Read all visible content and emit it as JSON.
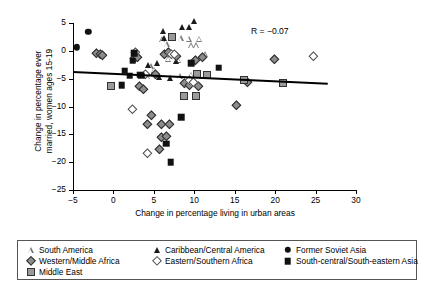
{
  "chart_data": {
    "type": "scatter",
    "title": "",
    "xlabel": "Change in percentage living in urban areas",
    "ylabel": "Change in percentage ever\nmarried, women ages 15-19",
    "xlim": [
      -5,
      30
    ],
    "ylim": [
      -25,
      5
    ],
    "xticks": [
      -5,
      0,
      5,
      10,
      15,
      20,
      25,
      30
    ],
    "yticks": [
      5,
      0,
      -5,
      -10,
      -15,
      -20,
      -25
    ],
    "grid": false,
    "legend_position": "below-plot",
    "annotation": "R = −0.07",
    "trendline": {
      "x0": -5,
      "y0": -3.6,
      "x1": 26.5,
      "y1": -5.7
    },
    "series": [
      {
        "name": "South America",
        "marker": "triangle-open",
        "color": "#7a7a7a",
        "points": [
          [
            6.0,
            2.1
          ],
          [
            6.6,
            1.2
          ],
          [
            8.3,
            2.3
          ],
          [
            9.3,
            2.2
          ],
          [
            9.6,
            1.0
          ],
          [
            10.2,
            1.0
          ],
          [
            10.6,
            2.2
          ],
          [
            11.3,
            -0.6
          ],
          [
            6.8,
            -1.4
          ],
          [
            8.0,
            -1.6
          ],
          [
            4.6,
            -2.7
          ],
          [
            5.0,
            -3.4
          ],
          [
            4.2,
            -4.6
          ],
          [
            8.2,
            -4.6
          ],
          [
            9.6,
            -4.3
          ]
        ]
      },
      {
        "name": "Caribbean/Central America",
        "marker": "triangle-filled",
        "color": "#1a1a1a",
        "points": [
          [
            6.1,
            3.5
          ],
          [
            8.5,
            4.2
          ],
          [
            10.0,
            5.3
          ],
          [
            9.4,
            4.3
          ],
          [
            6.3,
            2.3
          ],
          [
            7.8,
            -1.8
          ],
          [
            5.4,
            -2.2
          ],
          [
            4.3,
            -2.6
          ],
          [
            7.0,
            -4.9
          ],
          [
            5.6,
            -4.7
          ]
        ]
      },
      {
        "name": "Former Soviet Asia",
        "marker": "circle-filled",
        "color": "#111111",
        "points": [
          [
            -3.1,
            3.4
          ],
          [
            -4.5,
            0.6
          ]
        ]
      },
      {
        "name": "Western/Middle Africa",
        "marker": "diamond-gray",
        "color": "#8c8c8c",
        "points": [
          [
            -1.6,
            -1.1
          ],
          [
            -1.2,
            -1.3
          ],
          [
            -0.9,
            -1.5
          ],
          [
            3.0,
            -2.0
          ],
          [
            3.4,
            -1.9
          ],
          [
            6.8,
            -1.2
          ],
          [
            8.2,
            -1.7
          ],
          [
            7.3,
            -0.9
          ],
          [
            10.6,
            -2.3
          ],
          [
            11.4,
            -1.9
          ],
          [
            3.6,
            -7.1
          ],
          [
            4.2,
            -7.5
          ],
          [
            9.2,
            -6.5
          ],
          [
            9.8,
            -6.8
          ],
          [
            10.9,
            -7.1
          ],
          [
            5.1,
            -12.2
          ],
          [
            4.6,
            -13.9
          ],
          [
            6.4,
            -13.8
          ],
          [
            7.4,
            -13.9
          ],
          [
            6.4,
            -16.2
          ],
          [
            7.0,
            -16.1
          ],
          [
            6.1,
            -18.4
          ],
          [
            20.3,
            -2.2
          ],
          [
            17.0,
            -6.4
          ],
          [
            15.6,
            -10.4
          ],
          [
            5.6,
            -4.8
          ]
        ]
      },
      {
        "name": "Eastern/Southern Africa",
        "marker": "diamond-open",
        "color": "#4d4d4d",
        "points": [
          [
            3.2,
            -0.9
          ],
          [
            7.6,
            -1.2
          ],
          [
            8.0,
            -1.3
          ],
          [
            4.4,
            -4.9
          ],
          [
            9.8,
            -6.0
          ],
          [
            10.3,
            -6.4
          ],
          [
            2.8,
            -11.1
          ],
          [
            4.6,
            -19.0
          ],
          [
            25.2,
            -1.7
          ]
        ]
      },
      {
        "name": "South-central/South-eastern Asia",
        "marker": "square-filled",
        "color": "#111111",
        "points": [
          [
            2.6,
            -0.4
          ],
          [
            2.4,
            -1.8
          ],
          [
            1.4,
            -3.6
          ],
          [
            3.3,
            -4.3
          ],
          [
            3.4,
            -4.5
          ],
          [
            9.6,
            -2.2
          ],
          [
            13.0,
            -3.0
          ],
          [
            1.0,
            -6.2
          ],
          [
            2.0,
            -4.5
          ],
          [
            8.4,
            -11.9
          ],
          [
            6.5,
            -16.7
          ],
          [
            7.1,
            -20.0
          ]
        ]
      },
      {
        "name": "Middle East",
        "marker": "square-gray",
        "color": "#9a9a9a",
        "points": [
          [
            7.2,
            2.4
          ],
          [
            -0.3,
            -6.3
          ],
          [
            10.3,
            -4.1
          ],
          [
            11.6,
            -4.4
          ],
          [
            8.7,
            -8.1
          ],
          [
            10.2,
            -8.2
          ],
          [
            16.2,
            -5.2
          ],
          [
            21.0,
            -5.8
          ]
        ]
      }
    ]
  },
  "legend": {
    "items": [
      {
        "label": "South America",
        "marker": "triangle-open",
        "col": 0,
        "row": 0
      },
      {
        "label": "Caribbean/Central America",
        "marker": "triangle-filled",
        "col": 1,
        "row": 0
      },
      {
        "label": "Former Soviet Asia",
        "marker": "circle-filled",
        "col": 2,
        "row": 0
      },
      {
        "label": "Western/Middle Africa",
        "marker": "diamond-gray",
        "col": 0,
        "row": 1
      },
      {
        "label": "Eastern/Southern Africa",
        "marker": "diamond-open",
        "col": 1,
        "row": 1
      },
      {
        "label": "South-central/South-eastern Asia",
        "marker": "square-filled",
        "col": 2,
        "row": 1
      },
      {
        "label": "Middle East",
        "marker": "square-gray",
        "col": 0,
        "row": 2
      }
    ]
  }
}
